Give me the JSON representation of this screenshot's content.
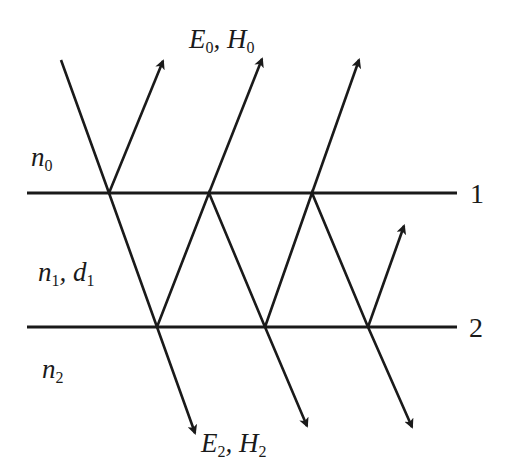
{
  "diagram": {
    "stroke_color": "#1a1a1a",
    "background": "#ffffff",
    "interfaces": [
      {
        "id": "1",
        "label": "1",
        "y": 193,
        "x1": 27,
        "x2": 457
      },
      {
        "id": "2",
        "label": "2",
        "y": 327,
        "x1": 27,
        "x2": 457
      }
    ],
    "media": [
      {
        "symbol": "n",
        "subscript": "0",
        "extra": "",
        "extra_subscript": ""
      },
      {
        "symbol": "n",
        "subscript": "1",
        "extra": "d",
        "extra_subscript": "1"
      },
      {
        "symbol": "n",
        "subscript": "2",
        "extra": "",
        "extra_subscript": ""
      }
    ],
    "field_labels": {
      "reflected": {
        "e": "E",
        "e_sub": "0",
        "h": "H",
        "h_sub": "0"
      },
      "transmitted": {
        "e": "E",
        "e_sub": "2",
        "h": "H",
        "h_sub": "2"
      }
    },
    "rays": [
      {
        "name": "incident-ray",
        "points": [
          [
            61,
            60
          ],
          [
            109,
            193
          ],
          [
            157,
            327
          ],
          [
            195,
            433
          ]
        ],
        "arrow": true
      },
      {
        "name": "reflected-ray-1",
        "points": [
          [
            109,
            193
          ],
          [
            163,
            61
          ]
        ],
        "arrow": true
      },
      {
        "name": "internal-ray-1",
        "points": [
          [
            157,
            327
          ],
          [
            209,
            193
          ],
          [
            265,
            327
          ],
          [
            307,
            426
          ]
        ],
        "arrow": true
      },
      {
        "name": "reflected-ray-2",
        "points": [
          [
            209,
            193
          ],
          [
            262,
            59
          ]
        ],
        "arrow": true
      },
      {
        "name": "internal-ray-2",
        "points": [
          [
            265,
            327
          ],
          [
            312,
            193
          ],
          [
            368,
            327
          ],
          [
            412,
            427
          ]
        ],
        "arrow": true
      },
      {
        "name": "reflected-ray-3",
        "points": [
          [
            312,
            193
          ],
          [
            359,
            60
          ]
        ],
        "arrow": true
      },
      {
        "name": "internal-ray-3",
        "points": [
          [
            368,
            327
          ],
          [
            404,
            226
          ]
        ],
        "arrow": true
      }
    ]
  }
}
